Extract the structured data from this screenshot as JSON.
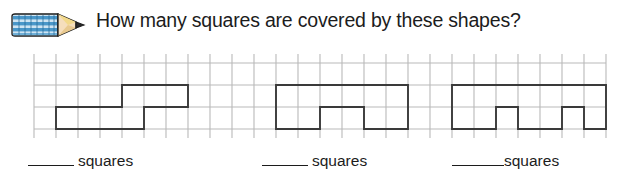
{
  "header": {
    "icon": "pencil-icon",
    "question": "How many squares are covered by these shapes?"
  },
  "grid": {
    "columns": 26,
    "rows": 3,
    "cell_size": 22,
    "origin_x": 34,
    "origin_y": 15,
    "line_color": "#b9b9b9",
    "shape_color": "#3a3a3a",
    "stub_length": 9
  },
  "shapes": [
    {
      "name": "shape-1-staircase",
      "label": "staircase shape",
      "squares": 6,
      "path": "M 1,2 L 1,3 L 5,3 L 5,2 L 7,2 L 7,1 L 4,1 L 4,2 Z"
    },
    {
      "name": "shape-2-notched-rectangle",
      "label": "rectangle with bottom notch",
      "squares": 8,
      "path": "M 11,1 L 11,3 L 13,3 L 13,2 L 15,2 L 15,3 L 17,3 L 17,1 Z"
    },
    {
      "name": "shape-3-crenellated",
      "label": "rectangle with two bottom notches",
      "squares": 10,
      "path": "M 19,1 L 19,3 L 21,3 L 21,2 L 22,2 L 22,3 L 24,3 L 24,2 L 25,2 L 25,3 L 26,3 L 26,1 Z"
    }
  ],
  "answers": [
    {
      "blank": "",
      "label": "squares"
    },
    {
      "blank": "",
      "label": "squares"
    },
    {
      "blank": "",
      "label": "squares"
    }
  ],
  "colors": {
    "pencil_body": "#3d8fc4",
    "pencil_stripe": "#ffffff",
    "pencil_tip": "#f2d98a",
    "pencil_point": "#2b2b2b",
    "grid_line": "#b9b9b9",
    "shape_outline": "#3a3a3a",
    "text": "#1c1c1c"
  }
}
